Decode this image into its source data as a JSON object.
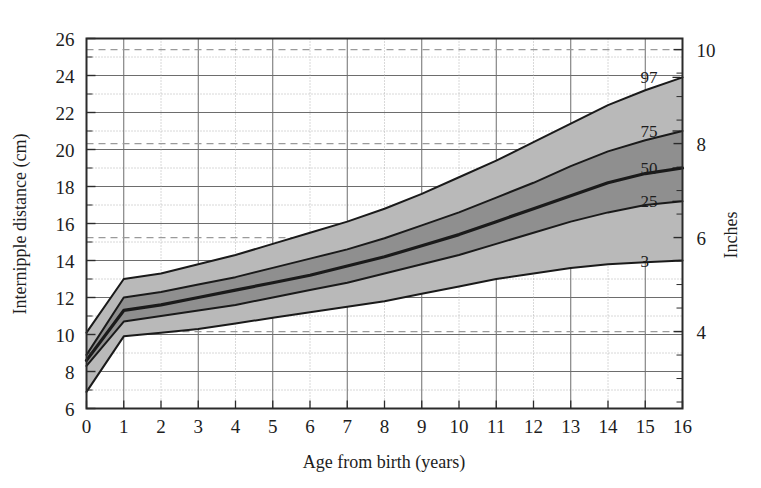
{
  "chart_data": {
    "type": "line",
    "title": "",
    "xlabel": "Age from birth (years)",
    "ylabel": "Internipple distance (cm)",
    "y2label": "Inches",
    "xlim": [
      0,
      16
    ],
    "ylim": [
      6,
      26
    ],
    "y2lim": [
      2.362,
      10.236
    ],
    "grid": true,
    "legend_position": "inside-right",
    "x_ticks": [
      "0",
      "1",
      "2",
      "3",
      "4",
      "5",
      "6",
      "7",
      "8",
      "9",
      "10",
      "11",
      "12",
      "13",
      "14",
      "15",
      "16"
    ],
    "x_tick_values": [
      0,
      1,
      2,
      3,
      4,
      5,
      6,
      7,
      8,
      9,
      10,
      11,
      12,
      13,
      14,
      15,
      16
    ],
    "y_ticks": [
      "6",
      "8",
      "10",
      "12",
      "14",
      "16",
      "18",
      "20",
      "22",
      "24",
      "26"
    ],
    "y_tick_values": [
      6,
      8,
      10,
      12,
      14,
      16,
      18,
      20,
      22,
      24,
      26
    ],
    "y_minor_tick_values": [
      7,
      9,
      11,
      13,
      15,
      17,
      19,
      21,
      23,
      25
    ],
    "y2_ticks": [
      "4",
      "6",
      "8",
      "10"
    ],
    "y2_tick_values_cm": [
      10.16,
      15.24,
      20.32,
      25.4
    ],
    "y2_minor_tick_values_cm": [
      6.35,
      7.62,
      8.89,
      11.43,
      12.7,
      13.97,
      16.51,
      17.78,
      19.05,
      21.59,
      22.86,
      24.13
    ],
    "x": [
      0,
      1,
      2,
      3,
      4,
      5,
      6,
      7,
      8,
      9,
      10,
      11,
      12,
      13,
      14,
      15,
      16
    ],
    "series": [
      {
        "name": "97",
        "label": "97",
        "values": [
          10.1,
          13.0,
          13.3,
          13.8,
          14.3,
          14.9,
          15.5,
          16.1,
          16.8,
          17.6,
          18.5,
          19.4,
          20.4,
          21.4,
          22.4,
          23.2,
          23.9
        ]
      },
      {
        "name": "75",
        "label": "75",
        "values": [
          8.9,
          12.0,
          12.3,
          12.7,
          13.1,
          13.6,
          14.1,
          14.6,
          15.2,
          15.9,
          16.6,
          17.4,
          18.2,
          19.1,
          19.9,
          20.5,
          21.0
        ]
      },
      {
        "name": "50",
        "label": "50",
        "values": [
          8.6,
          11.3,
          11.6,
          12.0,
          12.4,
          12.8,
          13.2,
          13.7,
          14.2,
          14.8,
          15.4,
          16.1,
          16.8,
          17.5,
          18.2,
          18.7,
          19.0
        ]
      },
      {
        "name": "25",
        "label": "25",
        "values": [
          8.3,
          10.7,
          11.0,
          11.3,
          11.6,
          12.0,
          12.4,
          12.8,
          13.3,
          13.8,
          14.3,
          14.9,
          15.5,
          16.1,
          16.6,
          17.0,
          17.2
        ]
      },
      {
        "name": "3",
        "label": "3",
        "values": [
          6.9,
          9.9,
          10.1,
          10.3,
          10.6,
          10.9,
          11.2,
          11.5,
          11.8,
          12.2,
          12.6,
          13.0,
          13.3,
          13.6,
          13.8,
          13.9,
          14.0
        ]
      }
    ],
    "bands": [
      {
        "name": "97-75",
        "upper": "97",
        "lower": "75",
        "shade": "light"
      },
      {
        "name": "75-50",
        "upper": "75",
        "lower": "50",
        "shade": "dark"
      },
      {
        "name": "50-25",
        "upper": "50",
        "lower": "25",
        "shade": "dark"
      },
      {
        "name": "25-3",
        "upper": "25",
        "lower": "3",
        "shade": "light"
      }
    ],
    "colors": {
      "band_light": "#b9b9b9",
      "band_dark": "#8f8f8f",
      "curve": "#1a1a1a",
      "grid_major": "#6d6d6d",
      "grid_minor": "#a9a9a9",
      "grid_inch_dashed": "#9a9a9a",
      "frame": "#2b2b2b",
      "text": "#1d1d1d"
    }
  },
  "labels": {
    "xlabel": "Age from birth (years)",
    "ylabel": "Internipple distance (cm)",
    "y2label": "Inches"
  }
}
